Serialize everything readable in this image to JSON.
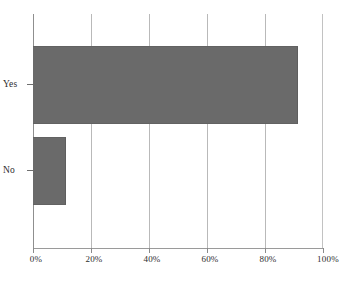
{
  "chart_data": {
    "type": "bar",
    "orientation": "horizontal",
    "title": "",
    "subtitle": "",
    "xlabel": "",
    "ylabel": "",
    "categories": [
      "Yes",
      "No"
    ],
    "values": [
      91,
      11
    ],
    "value_unit": "%",
    "xlim": [
      0,
      100
    ],
    "xticks": [
      0,
      20,
      40,
      60,
      80,
      100
    ],
    "xtick_labels": [
      "0%",
      "20%",
      "40%",
      "60%",
      "80%",
      "100%"
    ],
    "grid": "vertical",
    "legend": "none",
    "series": [
      {
        "name": "",
        "values": [
          91,
          11
        ]
      }
    ],
    "bar_color": "#6a6a6a",
    "gridline_color": "#b9b9b9",
    "axis_color": "#8f8f8f",
    "background": "#ffffff"
  },
  "axes": {
    "y_categories": [
      {
        "label": "Yes",
        "value": 91
      },
      {
        "label": "No",
        "value": 11
      }
    ],
    "x_ticks": [
      {
        "label": "0%",
        "value": 0
      },
      {
        "label": "20%",
        "value": 20
      },
      {
        "label": "40%",
        "value": 40
      },
      {
        "label": "60%",
        "value": 60
      },
      {
        "label": "80%",
        "value": 80
      },
      {
        "label": "100%",
        "value": 100
      }
    ]
  }
}
